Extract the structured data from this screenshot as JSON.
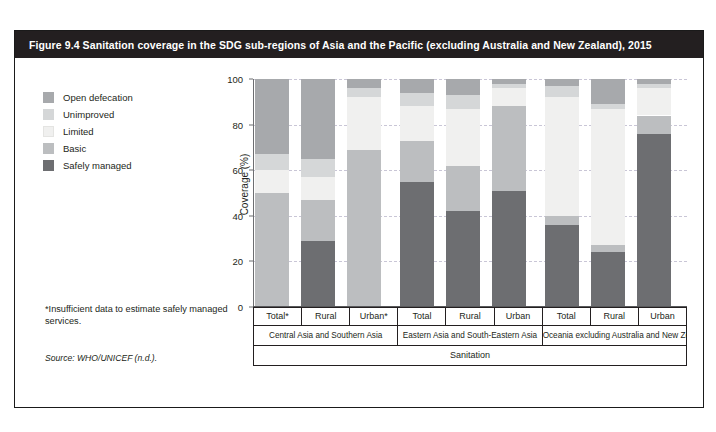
{
  "figure": {
    "title": "Figure 9.4  Sanitation coverage in the SDG sub-regions of Asia and the Pacific (excluding Australia and New Zealand), 2015",
    "footnote": "*Insufficient data to estimate safely managed services.",
    "source": "Source: WHO/UNICEF (n.d.)."
  },
  "legend": {
    "items": [
      {
        "label": "Open defecation",
        "color": "#a7a9ac"
      },
      {
        "label": "Unimproved",
        "color": "#d5d7d8"
      },
      {
        "label": "Limited",
        "color": "#f0f0ef"
      },
      {
        "label": "Basic",
        "color": "#bcbec0"
      },
      {
        "label": "Safely managed",
        "color": "#6d6e71"
      }
    ]
  },
  "axis": {
    "ylabel": "Coverage (%)",
    "yticks": [
      0,
      20,
      40,
      60,
      80,
      100
    ],
    "ymin": 0,
    "ymax": 100
  },
  "xaxis": {
    "bottom_label": "Sanitation",
    "groups": [
      {
        "name": "Central Asia and Southern Asia",
        "bars": [
          "Total*",
          "Rural",
          "Urban*"
        ]
      },
      {
        "name": "Eastern Asia and South-Eastern Asia",
        "bars": [
          "Total",
          "Rural",
          "Urban"
        ]
      },
      {
        "name": "Oceania excluding Australia and New Zealand",
        "bars": [
          "Total",
          "Rural",
          "Urban"
        ]
      }
    ]
  },
  "chart_data": {
    "type": "bar",
    "stacked": true,
    "title": "Sanitation coverage in the SDG sub-regions of Asia and the Pacific (excluding Australia and New Zealand), 2015",
    "xlabel": "Sanitation",
    "ylabel": "Coverage (%)",
    "ylim": [
      0,
      100
    ],
    "grid": true,
    "legend_position": "upper-left-outside",
    "categories": [
      "Central Asia and Southern Asia - Total*",
      "Central Asia and Southern Asia - Rural",
      "Central Asia and Southern Asia - Urban*",
      "Eastern Asia and South-Eastern Asia - Total",
      "Eastern Asia and South-Eastern Asia - Rural",
      "Eastern Asia and South-Eastern Asia - Urban",
      "Oceania excluding Australia and New Zealand - Total",
      "Oceania excluding Australia and New Zealand - Rural",
      "Oceania excluding Australia and New Zealand - Urban"
    ],
    "series": [
      {
        "name": "Safely managed",
        "color": "#6d6e71",
        "values": [
          0,
          29,
          0,
          55,
          42,
          51,
          36,
          24,
          76
        ]
      },
      {
        "name": "Basic",
        "color": "#bcbec0",
        "values": [
          50,
          18,
          69,
          18,
          20,
          37,
          4,
          3,
          8
        ]
      },
      {
        "name": "Limited",
        "color": "#f0f0ef",
        "values": [
          10,
          10,
          23,
          15,
          25,
          8,
          52,
          60,
          12
        ]
      },
      {
        "name": "Unimproved",
        "color": "#d5d7d8",
        "values": [
          7,
          8,
          4,
          6,
          6,
          2,
          5,
          2,
          2
        ]
      },
      {
        "name": "Open defecation",
        "color": "#a7a9ac",
        "values": [
          33,
          35,
          4,
          6,
          7,
          2,
          3,
          11,
          2
        ]
      }
    ]
  },
  "bars": [
    {
      "label": "Total*",
      "group": 0,
      "x": 2,
      "segments": [
        {
          "name": "Basic",
          "from": 0,
          "to": 50,
          "color": "#bcbec0"
        },
        {
          "name": "Limited",
          "from": 50,
          "to": 60,
          "color": "#f0f0ef"
        },
        {
          "name": "Unimproved",
          "from": 60,
          "to": 67,
          "color": "#d5d7d8"
        },
        {
          "name": "Open defecation",
          "from": 67,
          "to": 100,
          "color": "#a7a9ac"
        }
      ]
    },
    {
      "label": "Rural",
      "group": 0,
      "x": 48,
      "segments": [
        {
          "name": "Safely managed",
          "from": 0,
          "to": 29,
          "color": "#6d6e71"
        },
        {
          "name": "Basic",
          "from": 29,
          "to": 47,
          "color": "#bcbec0"
        },
        {
          "name": "Limited",
          "from": 47,
          "to": 57,
          "color": "#f0f0ef"
        },
        {
          "name": "Unimproved",
          "from": 57,
          "to": 65,
          "color": "#d5d7d8"
        },
        {
          "name": "Open defecation",
          "from": 65,
          "to": 100,
          "color": "#a7a9ac"
        }
      ]
    },
    {
      "label": "Urban*",
      "group": 0,
      "x": 94,
      "segments": [
        {
          "name": "Basic",
          "from": 0,
          "to": 69,
          "color": "#bcbec0"
        },
        {
          "name": "Limited",
          "from": 69,
          "to": 92,
          "color": "#f0f0ef"
        },
        {
          "name": "Unimproved",
          "from": 92,
          "to": 96,
          "color": "#d5d7d8"
        },
        {
          "name": "Open defecation",
          "from": 96,
          "to": 100,
          "color": "#a7a9ac"
        }
      ]
    },
    {
      "label": "Total",
      "group": 1,
      "x": 147,
      "segments": [
        {
          "name": "Safely managed",
          "from": 0,
          "to": 55,
          "color": "#6d6e71"
        },
        {
          "name": "Basic",
          "from": 55,
          "to": 73,
          "color": "#bcbec0"
        },
        {
          "name": "Limited",
          "from": 73,
          "to": 88,
          "color": "#f0f0ef"
        },
        {
          "name": "Unimproved",
          "from": 88,
          "to": 94,
          "color": "#d5d7d8"
        },
        {
          "name": "Open defecation",
          "from": 94,
          "to": 100,
          "color": "#a7a9ac"
        }
      ]
    },
    {
      "label": "Rural",
      "group": 1,
      "x": 193,
      "segments": [
        {
          "name": "Safely managed",
          "from": 0,
          "to": 42,
          "color": "#6d6e71"
        },
        {
          "name": "Basic",
          "from": 42,
          "to": 62,
          "color": "#bcbec0"
        },
        {
          "name": "Limited",
          "from": 62,
          "to": 87,
          "color": "#f0f0ef"
        },
        {
          "name": "Unimproved",
          "from": 87,
          "to": 93,
          "color": "#d5d7d8"
        },
        {
          "name": "Open defecation",
          "from": 93,
          "to": 100,
          "color": "#a7a9ac"
        }
      ]
    },
    {
      "label": "Urban",
      "group": 1,
      "x": 239,
      "segments": [
        {
          "name": "Safely managed",
          "from": 0,
          "to": 51,
          "color": "#6d6e71"
        },
        {
          "name": "Basic",
          "from": 51,
          "to": 88,
          "color": "#bcbec0"
        },
        {
          "name": "Limited",
          "from": 88,
          "to": 96,
          "color": "#f0f0ef"
        },
        {
          "name": "Unimproved",
          "from": 96,
          "to": 98,
          "color": "#d5d7d8"
        },
        {
          "name": "Open defecation",
          "from": 98,
          "to": 100,
          "color": "#a7a9ac"
        }
      ]
    },
    {
      "label": "Total",
      "group": 2,
      "x": 292,
      "segments": [
        {
          "name": "Safely managed",
          "from": 0,
          "to": 36,
          "color": "#6d6e71"
        },
        {
          "name": "Basic",
          "from": 36,
          "to": 40,
          "color": "#bcbec0"
        },
        {
          "name": "Limited",
          "from": 40,
          "to": 92,
          "color": "#f0f0ef"
        },
        {
          "name": "Unimproved",
          "from": 92,
          "to": 97,
          "color": "#d5d7d8"
        },
        {
          "name": "Open defecation",
          "from": 97,
          "to": 100,
          "color": "#a7a9ac"
        }
      ]
    },
    {
      "label": "Rural",
      "group": 2,
      "x": 338,
      "segments": [
        {
          "name": "Safely managed",
          "from": 0,
          "to": 24,
          "color": "#6d6e71"
        },
        {
          "name": "Basic",
          "from": 24,
          "to": 27,
          "color": "#bcbec0"
        },
        {
          "name": "Limited",
          "from": 27,
          "to": 87,
          "color": "#f0f0ef"
        },
        {
          "name": "Unimproved",
          "from": 87,
          "to": 89,
          "color": "#d5d7d8"
        },
        {
          "name": "Open defecation",
          "from": 89,
          "to": 100,
          "color": "#a7a9ac"
        }
      ]
    },
    {
      "label": "Urban",
      "group": 2,
      "x": 384,
      "segments": [
        {
          "name": "Safely managed",
          "from": 0,
          "to": 76,
          "color": "#6d6e71"
        },
        {
          "name": "Basic",
          "from": 76,
          "to": 84,
          "color": "#bcbec0"
        },
        {
          "name": "Limited",
          "from": 84,
          "to": 96,
          "color": "#f0f0ef"
        },
        {
          "name": "Unimproved",
          "from": 96,
          "to": 98,
          "color": "#d5d7d8"
        },
        {
          "name": "Open defecation",
          "from": 98,
          "to": 100,
          "color": "#a7a9ac"
        }
      ]
    }
  ]
}
